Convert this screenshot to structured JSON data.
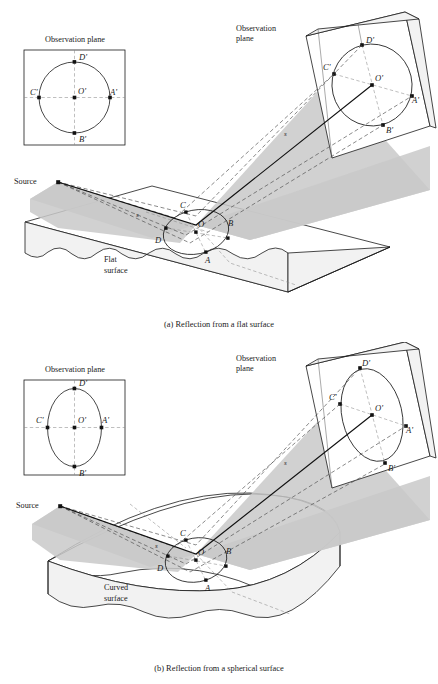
{
  "figure": {
    "background_color": "#ffffff",
    "ink_color": "#1a1a1a",
    "beam_color": "#c9c9c9"
  },
  "panels": [
    {
      "id": "a",
      "caption": "(a)  Reflection from a flat surface",
      "surface_label_line1": "Flat",
      "surface_label_line2": "surface",
      "source_label": "Source",
      "ray_label": "s",
      "inset": {
        "title": "Observation plane",
        "shape": "circle",
        "points": [
          {
            "label": "D'",
            "position": "top"
          },
          {
            "label": "C'",
            "position": "left"
          },
          {
            "label": "O'",
            "position": "center"
          },
          {
            "label": "A'",
            "position": "right"
          },
          {
            "label": "B'",
            "position": "bottom"
          }
        ]
      },
      "observation_plane": {
        "title_line1": "Observation",
        "title_line2": "plane",
        "shape": "circle",
        "points": [
          {
            "label": "D'",
            "position": "top"
          },
          {
            "label": "C'",
            "position": "left"
          },
          {
            "label": "O'",
            "position": "center"
          },
          {
            "label": "A'",
            "position": "right"
          },
          {
            "label": "B'",
            "position": "bottom"
          }
        ]
      },
      "spot_points": [
        {
          "label": "C",
          "position": "upper-left"
        },
        {
          "label": "O",
          "position": "center"
        },
        {
          "label": "B",
          "position": "right"
        },
        {
          "label": "D",
          "position": "lower-left"
        },
        {
          "label": "A",
          "position": "bottom"
        }
      ]
    },
    {
      "id": "b",
      "caption": "(b)  Reflection from a spherical surface",
      "surface_label_line1": "Curved",
      "surface_label_line2": "surface",
      "source_label": "Source",
      "ray_label": "s",
      "inset": {
        "title": "Observation plane",
        "shape": "ellipse-vertical",
        "points": [
          {
            "label": "D'",
            "position": "top"
          },
          {
            "label": "C'",
            "position": "left"
          },
          {
            "label": "O'",
            "position": "center"
          },
          {
            "label": "A'",
            "position": "right"
          },
          {
            "label": "B'",
            "position": "bottom"
          }
        ]
      },
      "observation_plane": {
        "title_line1": "Observation",
        "title_line2": "plane",
        "shape": "ellipse-vertical",
        "points": [
          {
            "label": "D'",
            "position": "top"
          },
          {
            "label": "C'",
            "position": "left"
          },
          {
            "label": "O'",
            "position": "center"
          },
          {
            "label": "A'",
            "position": "right"
          },
          {
            "label": "B'",
            "position": "bottom"
          }
        ]
      },
      "spot_points": [
        {
          "label": "C",
          "position": "upper-left"
        },
        {
          "label": "O",
          "position": "center"
        },
        {
          "label": "B",
          "position": "right"
        },
        {
          "label": "D",
          "position": "lower-left"
        },
        {
          "label": "A",
          "position": "bottom"
        }
      ]
    }
  ]
}
